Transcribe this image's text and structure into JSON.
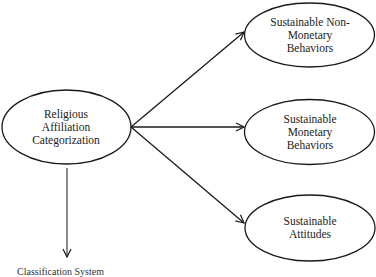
{
  "diagram": {
    "source_node": {
      "lines": [
        "Religious",
        "Affiliation",
        "Categorization"
      ]
    },
    "target_nodes": [
      {
        "lines": [
          "Sustainable Non-",
          "Monetary",
          "Behaviors"
        ]
      },
      {
        "lines": [
          "Sustainable",
          "Monetary",
          "Behaviors"
        ]
      },
      {
        "lines": [
          "Sustainable",
          "Attitudes"
        ]
      }
    ],
    "bottom_note": "Classification System"
  },
  "colors": {
    "stroke": "#1a1a1a",
    "text": "#222222",
    "background": "#ffffff"
  }
}
